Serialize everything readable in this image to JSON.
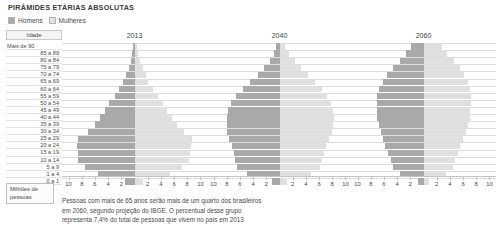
{
  "header": {
    "title": "PIRÂMIDES ETÁRIAS ABSOLUTAS"
  },
  "legend": {
    "men_label": "Homens",
    "women_label": "Mulheres",
    "men_color": "#a9a9a9",
    "women_color": "#e0e0e0"
  },
  "axis_column": {
    "header_label": "Idade",
    "unit_label": "Milhões de pessoas"
  },
  "caption": {
    "line1": "Pessoas com mais de 65 anos serão mais de um quarto dos brasileiros",
    "line2": "em 2060, segundo projeção do IBGE. O percentual desse grupo",
    "line3": "representa 7,4% do total de pessoas que vivem no país em 2013"
  },
  "chart_data": {
    "type": "bar",
    "subtype": "population-pyramid",
    "title": "PIRÂMIDES ETÁRIAS ABSOLUTAS",
    "xlabel": "Milhões de pessoas",
    "ylabel": "Idade",
    "xlim": [
      -11,
      11
    ],
    "xticks": [
      10,
      8,
      6,
      4,
      2,
      2,
      4,
      6,
      8,
      10
    ],
    "grid": true,
    "legend_position": "top-left",
    "units": "milhões de pessoas",
    "categories": [
      "Mais de 90",
      "85 a 89",
      "80 a 84",
      "75 a 79",
      "70 a 74",
      "65 a 69",
      "60 a 64",
      "55 a 59",
      "50 a 54",
      "45 a 49",
      "40 a 44",
      "35 a 39",
      "30 a 34",
      "25 a 29",
      "20 a 24",
      "15 a 19",
      "10 a 14",
      "5 a 9",
      "1 a 4",
      "0 a 1"
    ],
    "panels": [
      {
        "year": "2013",
        "series": [
          {
            "name": "Homens",
            "values": [
              0.2,
              0.35,
              0.6,
              0.9,
              1.3,
              1.7,
              2.3,
              3.0,
              3.8,
              4.5,
              5.2,
              6.0,
              7.1,
              8.6,
              8.7,
              8.6,
              8.6,
              7.5,
              5.6,
              1.4
            ]
          },
          {
            "name": "Mulheres",
            "values": [
              0.35,
              0.55,
              0.9,
              1.25,
              1.7,
              2.1,
              2.8,
              3.5,
              4.3,
              5.0,
              5.7,
              6.5,
              7.5,
              8.7,
              8.6,
              8.4,
              8.3,
              7.2,
              5.4,
              1.35
            ]
          }
        ]
      },
      {
        "year": "2040",
        "series": [
          {
            "name": "Homens",
            "values": [
              0.5,
              0.9,
              1.5,
              2.3,
              3.3,
              4.5,
              5.6,
              6.6,
              7.3,
              7.8,
              8.0,
              8.0,
              7.9,
              7.6,
              7.2,
              6.9,
              6.7,
              6.5,
              5.0,
              1.2
            ]
          },
          {
            "name": "Mulheres",
            "values": [
              0.9,
              1.5,
              2.3,
              3.2,
              4.3,
              5.4,
              6.4,
              7.2,
              7.8,
              8.1,
              8.2,
              8.1,
              7.9,
              7.5,
              7.1,
              6.7,
              6.5,
              6.2,
              4.8,
              1.15
            ]
          }
        ]
      },
      {
        "year": "2060",
        "series": [
          {
            "name": "Homens",
            "values": [
              1.9,
              2.6,
              3.6,
              4.6,
              5.5,
              6.2,
              6.7,
              7.0,
              7.1,
              7.1,
              7.0,
              6.8,
              6.5,
              6.2,
              5.8,
              5.4,
              5.0,
              4.6,
              3.5,
              0.85
            ]
          },
          {
            "name": "Mulheres",
            "values": [
              2.8,
              3.6,
              4.6,
              5.5,
              6.2,
              6.7,
              7.0,
              7.2,
              7.2,
              7.1,
              7.0,
              6.7,
              6.4,
              6.0,
              5.6,
              5.2,
              4.8,
              4.4,
              3.4,
              0.82
            ]
          }
        ]
      }
    ]
  }
}
